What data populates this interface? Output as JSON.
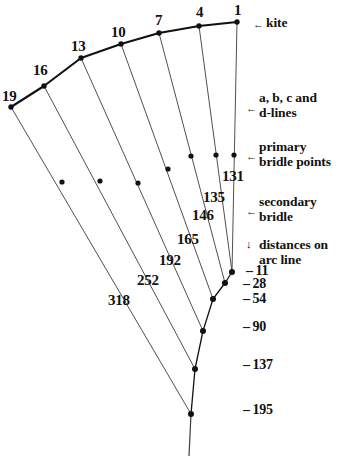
{
  "figure": {
    "background_color": "#ffffff",
    "ink_color": "#111111",
    "line_color": "#3c3c3c",
    "arc_color": "#111111"
  },
  "arc_labels": [
    {
      "text": "19",
      "x": 2,
      "y": 88
    },
    {
      "text": "16",
      "x": 33,
      "y": 62
    },
    {
      "text": "13",
      "x": 71,
      "y": 38
    },
    {
      "text": "10",
      "x": 111,
      "y": 24
    },
    {
      "text": "7",
      "x": 155,
      "y": 12
    },
    {
      "text": "4",
      "x": 196,
      "y": 4
    },
    {
      "text": "1",
      "x": 234,
      "y": 2
    }
  ],
  "inner_labels": [
    {
      "text": "318",
      "x": 108,
      "y": 292
    },
    {
      "text": "252",
      "x": 137,
      "y": 272
    },
    {
      "text": "192",
      "x": 159,
      "y": 252
    },
    {
      "text": "165",
      "x": 177,
      "y": 231
    },
    {
      "text": "146",
      "x": 192,
      "y": 207
    },
    {
      "text": "135",
      "x": 203,
      "y": 189
    },
    {
      "text": "131",
      "x": 222,
      "y": 168
    }
  ],
  "distance_labels": [
    {
      "text": "11",
      "x": 246,
      "y": 263
    },
    {
      "text": "28",
      "x": 243,
      "y": 276
    },
    {
      "text": "54",
      "x": 243,
      "y": 291
    },
    {
      "text": "90",
      "x": 243,
      "y": 319
    },
    {
      "text": "137",
      "x": 243,
      "y": 357
    },
    {
      "text": "195",
      "x": 243,
      "y": 402
    }
  ],
  "annotations": [
    {
      "id": "kite",
      "lines": [
        "kite"
      ],
      "arrow": "←",
      "arrow_x": 253,
      "arrow_y": 18,
      "text_x": 266,
      "text_y": 15
    },
    {
      "id": "abcd-lines",
      "lines": [
        "a, b, c and",
        "d-lines"
      ],
      "arrow": "←",
      "arrow_x": 246,
      "arrow_y": 102,
      "text_x": 259,
      "text_y": 90
    },
    {
      "id": "primary-bridle-points",
      "lines": [
        "primary",
        "bridle points"
      ],
      "arrow": "←",
      "arrow_x": 246,
      "arrow_y": 150,
      "text_x": 259,
      "text_y": 139
    },
    {
      "id": "secondary-bridle",
      "lines": [
        "secondary",
        "bridle"
      ],
      "arrow": "←",
      "arrow_x": 246,
      "arrow_y": 205,
      "text_x": 259,
      "text_y": 194
    },
    {
      "id": "distances-on-arc-line",
      "lines": [
        "distances on",
        "arc line"
      ],
      "arrow": "↓",
      "arrow_x": 246,
      "arrow_y": 238,
      "text_x": 259,
      "text_y": 237
    }
  ],
  "geometry": {
    "arc_points": [
      {
        "name": "p19",
        "label": "19",
        "x": 11,
        "y": 107
      },
      {
        "name": "p16",
        "label": "16",
        "x": 44,
        "y": 86
      },
      {
        "name": "p13",
        "label": "13",
        "x": 81,
        "y": 58
      },
      {
        "name": "p10",
        "label": "10",
        "x": 121,
        "y": 44
      },
      {
        "name": "p7",
        "label": "7",
        "x": 159,
        "y": 33
      },
      {
        "name": "p4",
        "label": "4",
        "x": 199,
        "y": 26
      },
      {
        "name": "p1",
        "label": "1",
        "x": 237,
        "y": 22
      }
    ],
    "arc_path": "M 11,107 L 44,86 L 81,58 L 121,44 L 159,33 L 199,26 L 237,22",
    "junctions": [
      {
        "name": "j11",
        "label": "11",
        "x": 232,
        "y": 272
      },
      {
        "name": "j28",
        "label": "28",
        "x": 225,
        "y": 283
      },
      {
        "name": "j54",
        "label": "54",
        "x": 213,
        "y": 299
      },
      {
        "name": "j90",
        "label": "90",
        "x": 203,
        "y": 331
      },
      {
        "name": "j137",
        "label": "137",
        "x": 195,
        "y": 369
      },
      {
        "name": "j195",
        "label": "195",
        "x": 191,
        "y": 414
      }
    ],
    "bridle_lines": [
      {
        "name": "line-1",
        "from": "p1",
        "to": "j11",
        "x1": 237,
        "y1": 22,
        "x2": 232,
        "y2": 272,
        "primary_point": {
          "x": 234,
          "y": 155
        }
      },
      {
        "name": "line-4",
        "from": "p4",
        "to": "j11",
        "x1": 199,
        "y1": 26,
        "x2": 232,
        "y2": 272,
        "primary_point": {
          "x": 216,
          "y": 155
        }
      },
      {
        "name": "line-7",
        "from": "p7",
        "to": "j28",
        "x1": 159,
        "y1": 33,
        "x2": 225,
        "y2": 283,
        "primary_point": {
          "x": 191,
          "y": 156
        }
      },
      {
        "name": "line-10",
        "from": "p10",
        "to": "j54",
        "x1": 121,
        "y1": 44,
        "x2": 213,
        "y2": 299,
        "primary_point": {
          "x": 168,
          "y": 169
        }
      },
      {
        "name": "line-13",
        "from": "p13",
        "to": "j90",
        "x1": 81,
        "y1": 58,
        "x2": 203,
        "y2": 331,
        "primary_point": {
          "x": 138,
          "y": 183
        }
      },
      {
        "name": "line-16",
        "from": "p16",
        "to": "j137",
        "x1": 44,
        "y1": 86,
        "x2": 195,
        "y2": 369,
        "primary_point": {
          "x": 100,
          "y": 181
        }
      },
      {
        "name": "line-19",
        "from": "p19",
        "to": "j195",
        "x1": 11,
        "y1": 107,
        "x2": 191,
        "y2": 414,
        "primary_point": {
          "x": 62,
          "y": 182
        }
      }
    ],
    "cascade_links": [
      {
        "name": "link-11-28",
        "x1": 232,
        "y1": 272,
        "x2": 225,
        "y2": 283
      },
      {
        "name": "link-28-54",
        "x1": 225,
        "y1": 283,
        "x2": 213,
        "y2": 299
      },
      {
        "name": "link-54-90",
        "x1": 213,
        "y1": 299,
        "x2": 203,
        "y2": 331
      },
      {
        "name": "link-90-137",
        "x1": 203,
        "y1": 331,
        "x2": 195,
        "y2": 369
      },
      {
        "name": "link-137-195",
        "x1": 195,
        "y1": 369,
        "x2": 191,
        "y2": 414
      }
    ],
    "tow_line": {
      "name": "tow-line",
      "x1": 191,
      "y1": 414,
      "x2": 189,
      "y2": 456
    }
  }
}
